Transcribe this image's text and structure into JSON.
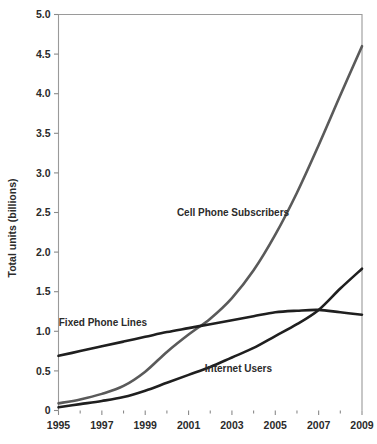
{
  "chart_data": {
    "type": "line",
    "title": "",
    "subtitle": "",
    "xlabel": "",
    "ylabel": "Total units (billions)",
    "xlim": [
      1995,
      2009
    ],
    "ylim": [
      0,
      5.0
    ],
    "grid": false,
    "legend_position": "inline-annotations",
    "x": [
      1995,
      1996,
      1997,
      1998,
      1999,
      2000,
      2001,
      2002,
      2003,
      2004,
      2005,
      2006,
      2007,
      2008,
      2009
    ],
    "x_tick_labels": [
      "1995",
      "1997",
      "1999",
      "2001",
      "2003",
      "2005",
      "2007",
      "2009"
    ],
    "x_tick_values": [
      1995,
      1997,
      1999,
      2001,
      2003,
      2005,
      2007,
      2009
    ],
    "x_minor_tick_values": [
      1996,
      1998,
      2000,
      2002,
      2004,
      2006,
      2008
    ],
    "y_tick_labels": [
      "0",
      "0.5",
      "1.0",
      "1.5",
      "2.0",
      "2.5",
      "3.0",
      "3.5",
      "4.0",
      "4.5",
      "5.0"
    ],
    "y_tick_values": [
      0,
      0.5,
      1.0,
      1.5,
      2.0,
      2.5,
      3.0,
      3.5,
      4.0,
      4.5,
      5.0
    ],
    "series": [
      {
        "name": "Cell Phone Subscribers",
        "color": "#5a5a5a",
        "stroke_width": 2.6,
        "label_x": 2003.05,
        "label_y": 2.46,
        "values": [
          0.09,
          0.14,
          0.21,
          0.31,
          0.49,
          0.74,
          0.96,
          1.16,
          1.42,
          1.77,
          2.22,
          2.75,
          3.35,
          3.98,
          4.6
        ]
      },
      {
        "name": "Fixed Phone Lines",
        "color": "#1f1f1f",
        "stroke_width": 2.6,
        "label_x": 1997.05,
        "label_y": 1.07,
        "values": [
          0.69,
          0.75,
          0.81,
          0.87,
          0.93,
          0.99,
          1.04,
          1.09,
          1.14,
          1.19,
          1.24,
          1.26,
          1.27,
          1.24,
          1.21
        ]
      },
      {
        "name": "Internet Users",
        "color": "#1f1f1f",
        "stroke_width": 2.6,
        "label_x": 2003.3,
        "label_y": 0.49,
        "values": [
          0.04,
          0.08,
          0.12,
          0.17,
          0.25,
          0.35,
          0.45,
          0.55,
          0.67,
          0.79,
          0.94,
          1.09,
          1.27,
          1.54,
          1.79
        ]
      }
    ]
  }
}
